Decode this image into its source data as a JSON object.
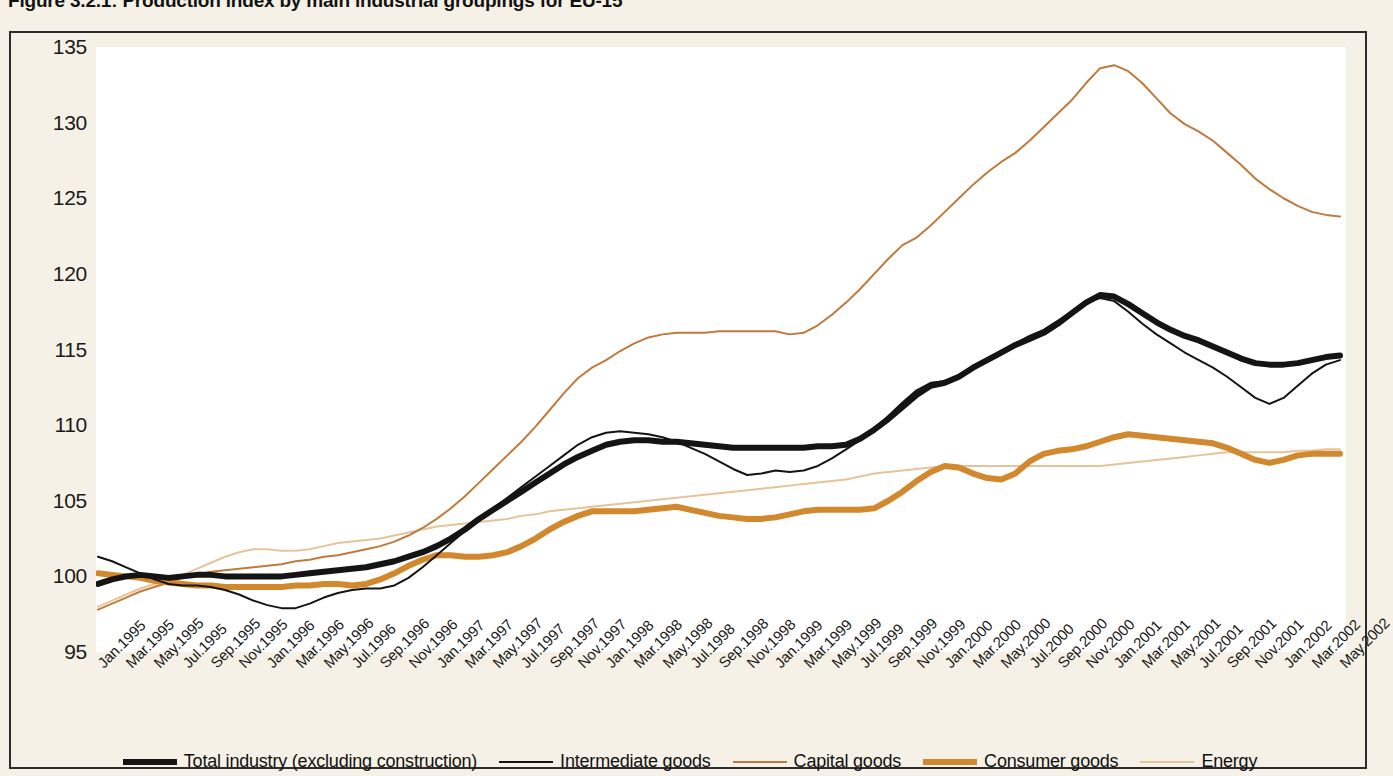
{
  "figure": {
    "title": "Figure 3.2.1: Production index by main industrial groupings for EU-15"
  },
  "legend": {
    "items": [
      {
        "label": "Total industry (excluding construction)",
        "color": "#141414",
        "width": 6
      },
      {
        "label": "Intermediate goods",
        "color": "#141414",
        "width": 2
      },
      {
        "label": "Capital goods",
        "color": "#c07a3c",
        "width": 2
      },
      {
        "label": "Consumer goods",
        "color": "#d2882c",
        "width": 6
      },
      {
        "label": "Energy",
        "color": "#e7c39a",
        "width": 2
      }
    ]
  },
  "chart_data": {
    "type": "line",
    "title": "Figure 3.2.1: Production index by main industrial groupings for EU-15",
    "xlabel": "",
    "ylabel": "",
    "ylim": [
      95,
      135
    ],
    "yticks": [
      95,
      100,
      105,
      110,
      115,
      120,
      125,
      130,
      135
    ],
    "grid": false,
    "legend_position": "bottom",
    "x_tick_labels": [
      "Jan.1995",
      "Mar.1995",
      "May.1995",
      "Jul.1995",
      "Sep.1995",
      "Nov.1995",
      "Jan.1996",
      "Mar.1996",
      "May.1996",
      "Jul.1996",
      "Sep.1996",
      "Nov.1996",
      "Jan.1997",
      "Mar.1997",
      "May.1997",
      "Jul.1997",
      "Sep.1997",
      "Nov.1997",
      "Jan.1998",
      "Mar.1998",
      "May.1998",
      "Jul.1998",
      "Sep.1998",
      "Nov.1998",
      "Jan.1999",
      "Mar.1999",
      "May.1999",
      "Jul.1999",
      "Sep.1999",
      "Nov.1999",
      "Jan.2000",
      "Mar.2000",
      "May.2000",
      "Jul.2000",
      "Sep.2000",
      "Nov.2000",
      "Jan.2001",
      "Mar.2001",
      "May.2001",
      "Jul.2001",
      "Sep.2001",
      "Nov.2001",
      "Jan.2002",
      "Mar.2002",
      "May.2002"
    ],
    "x_months": [
      "Jan.1995",
      "Feb.1995",
      "Mar.1995",
      "Apr.1995",
      "May.1995",
      "Jun.1995",
      "Jul.1995",
      "Aug.1995",
      "Sep.1995",
      "Oct.1995",
      "Nov.1995",
      "Dec.1995",
      "Jan.1996",
      "Feb.1996",
      "Mar.1996",
      "Apr.1996",
      "May.1996",
      "Jun.1996",
      "Jul.1996",
      "Aug.1996",
      "Sep.1996",
      "Oct.1996",
      "Nov.1996",
      "Dec.1996",
      "Jan.1997",
      "Feb.1997",
      "Mar.1997",
      "Apr.1997",
      "May.1997",
      "Jun.1997",
      "Jul.1997",
      "Aug.1997",
      "Sep.1997",
      "Oct.1997",
      "Nov.1997",
      "Dec.1997",
      "Jan.1998",
      "Feb.1998",
      "Mar.1998",
      "Apr.1998",
      "May.1998",
      "Jun.1998",
      "Jul.1998",
      "Aug.1998",
      "Sep.1998",
      "Oct.1998",
      "Nov.1998",
      "Dec.1998",
      "Jan.1999",
      "Feb.1999",
      "Mar.1999",
      "Apr.1999",
      "May.1999",
      "Jun.1999",
      "Jul.1999",
      "Aug.1999",
      "Sep.1999",
      "Oct.1999",
      "Nov.1999",
      "Dec.1999",
      "Jan.2000",
      "Feb.2000",
      "Mar.2000",
      "Apr.2000",
      "May.2000",
      "Jun.2000",
      "Jul.2000",
      "Aug.2000",
      "Sep.2000",
      "Oct.2000",
      "Nov.2000",
      "Dec.2000",
      "Jan.2001",
      "Feb.2001",
      "Mar.2001",
      "Apr.2001",
      "May.2001",
      "Jun.2001",
      "Jul.2001",
      "Aug.2001",
      "Sep.2001",
      "Oct.2001",
      "Nov.2001",
      "Dec.2001",
      "Jan.2002",
      "Feb.2002",
      "Mar.2002",
      "Apr.2002",
      "May.2002"
    ],
    "series": [
      {
        "name": "Total industry (excluding construction)",
        "color": "#141414",
        "width": 6,
        "values": [
          99.5,
          99.8,
          100.0,
          100.1,
          100.0,
          99.9,
          100.0,
          100.1,
          100.1,
          100.0,
          100.0,
          100.0,
          100.0,
          100.0,
          100.1,
          100.2,
          100.3,
          100.4,
          100.5,
          100.6,
          100.8,
          101.0,
          101.3,
          101.6,
          102.0,
          102.5,
          103.1,
          103.8,
          104.4,
          105.0,
          105.6,
          106.2,
          106.8,
          107.4,
          107.9,
          108.3,
          108.7,
          108.9,
          109.0,
          109.0,
          108.9,
          108.9,
          108.8,
          108.7,
          108.6,
          108.5,
          108.5,
          108.5,
          108.5,
          108.5,
          108.5,
          108.6,
          108.6,
          108.7,
          109.1,
          109.7,
          110.4,
          111.2,
          112.0,
          112.6,
          112.8,
          113.2,
          113.8,
          114.3,
          114.8,
          115.3,
          115.7,
          116.1,
          116.7,
          117.4,
          118.1,
          118.6,
          118.5,
          118.0,
          117.4,
          116.8,
          116.3,
          115.9,
          115.6,
          115.2,
          114.8,
          114.4,
          114.1,
          114.0,
          114.0,
          114.1,
          114.3,
          114.5,
          114.6
        ]
      },
      {
        "name": "Intermediate goods",
        "color": "#141414",
        "width": 2,
        "values": [
          101.3,
          101.0,
          100.6,
          100.2,
          99.8,
          99.5,
          99.4,
          99.4,
          99.3,
          99.1,
          98.8,
          98.4,
          98.1,
          97.9,
          97.9,
          98.2,
          98.6,
          98.9,
          99.1,
          99.2,
          99.2,
          99.4,
          99.9,
          100.6,
          101.4,
          102.2,
          103.0,
          103.8,
          104.5,
          105.2,
          105.9,
          106.6,
          107.3,
          108.0,
          108.7,
          109.2,
          109.5,
          109.6,
          109.5,
          109.4,
          109.2,
          108.9,
          108.5,
          108.1,
          107.6,
          107.1,
          106.7,
          106.8,
          107.0,
          106.9,
          107.0,
          107.3,
          107.8,
          108.4,
          109.0,
          109.8,
          110.6,
          111.5,
          112.3,
          112.8,
          112.9,
          113.3,
          113.9,
          114.4,
          114.9,
          115.4,
          115.9,
          116.3,
          116.9,
          117.5,
          118.1,
          118.4,
          118.2,
          117.5,
          116.7,
          116.0,
          115.4,
          114.8,
          114.3,
          113.8,
          113.2,
          112.5,
          111.8,
          111.4,
          111.8,
          112.6,
          113.4,
          114.0,
          114.3
        ]
      },
      {
        "name": "Capital goods",
        "color": "#c07a3c",
        "width": 2,
        "values": [
          97.8,
          98.2,
          98.6,
          99.0,
          99.3,
          99.6,
          99.9,
          100.1,
          100.3,
          100.4,
          100.5,
          100.6,
          100.7,
          100.8,
          101.0,
          101.1,
          101.3,
          101.4,
          101.6,
          101.8,
          102.0,
          102.3,
          102.7,
          103.2,
          103.8,
          104.5,
          105.3,
          106.2,
          107.1,
          108.0,
          108.9,
          109.9,
          111.0,
          112.1,
          113.1,
          113.8,
          114.3,
          114.9,
          115.4,
          115.8,
          116.0,
          116.1,
          116.1,
          116.1,
          116.2,
          116.2,
          116.2,
          116.2,
          116.2,
          116.0,
          116.1,
          116.6,
          117.3,
          118.1,
          119.0,
          120.0,
          121.0,
          121.9,
          122.4,
          123.2,
          124.1,
          125.0,
          125.9,
          126.7,
          127.4,
          128.0,
          128.8,
          129.7,
          130.6,
          131.5,
          132.6,
          133.6,
          133.8,
          133.4,
          132.6,
          131.6,
          130.6,
          129.9,
          129.4,
          128.8,
          128.0,
          127.2,
          126.3,
          125.6,
          125.0,
          124.5,
          124.1,
          123.9,
          123.8
        ]
      },
      {
        "name": "Consumer goods",
        "color": "#d2882c",
        "width": 6,
        "values": [
          100.2,
          100.1,
          100.0,
          99.9,
          99.7,
          99.6,
          99.5,
          99.4,
          99.4,
          99.3,
          99.3,
          99.3,
          99.3,
          99.3,
          99.4,
          99.4,
          99.5,
          99.5,
          99.4,
          99.5,
          99.8,
          100.2,
          100.7,
          101.1,
          101.4,
          101.4,
          101.3,
          101.3,
          101.4,
          101.6,
          102.0,
          102.5,
          103.1,
          103.6,
          104.0,
          104.3,
          104.3,
          104.3,
          104.3,
          104.4,
          104.5,
          104.6,
          104.4,
          104.2,
          104.0,
          103.9,
          103.8,
          103.8,
          103.9,
          104.1,
          104.3,
          104.4,
          104.4,
          104.4,
          104.4,
          104.5,
          105.0,
          105.6,
          106.3,
          106.9,
          107.3,
          107.2,
          106.8,
          106.5,
          106.4,
          106.8,
          107.6,
          108.1,
          108.3,
          108.4,
          108.6,
          108.9,
          109.2,
          109.4,
          109.3,
          109.2,
          109.1,
          109.0,
          108.9,
          108.8,
          108.5,
          108.1,
          107.7,
          107.5,
          107.7,
          108.0,
          108.1,
          108.1,
          108.1
        ]
      },
      {
        "name": "Energy",
        "color": "#e7c39a",
        "width": 2,
        "values": [
          98.0,
          98.4,
          98.8,
          99.2,
          99.5,
          99.8,
          100.1,
          100.5,
          100.9,
          101.3,
          101.6,
          101.8,
          101.8,
          101.7,
          101.7,
          101.8,
          102.0,
          102.2,
          102.3,
          102.4,
          102.5,
          102.7,
          102.9,
          103.1,
          103.3,
          103.4,
          103.5,
          103.6,
          103.7,
          103.8,
          104.0,
          104.1,
          104.3,
          104.4,
          104.5,
          104.6,
          104.7,
          104.8,
          104.9,
          105.0,
          105.1,
          105.2,
          105.3,
          105.4,
          105.5,
          105.6,
          105.7,
          105.8,
          105.9,
          106.0,
          106.1,
          106.2,
          106.3,
          106.4,
          106.6,
          106.8,
          106.9,
          107.0,
          107.1,
          107.2,
          107.3,
          107.3,
          107.3,
          107.3,
          107.3,
          107.3,
          107.3,
          107.3,
          107.3,
          107.3,
          107.3,
          107.3,
          107.4,
          107.5,
          107.6,
          107.7,
          107.8,
          107.9,
          108.0,
          108.1,
          108.2,
          108.2,
          108.2,
          108.2,
          108.2,
          108.3,
          108.3,
          108.4,
          108.4
        ]
      }
    ]
  }
}
